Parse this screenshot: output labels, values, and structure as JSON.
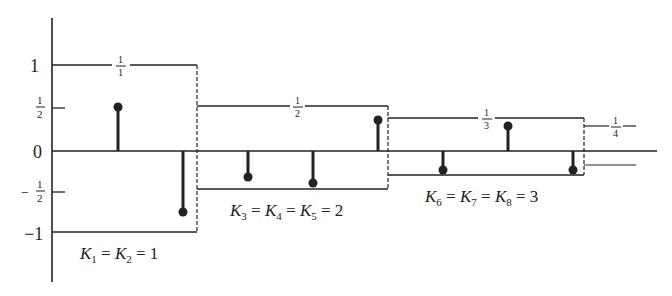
{
  "y_axis": {
    "ticks": [
      {
        "label": "1",
        "value": 1
      },
      {
        "num": "1",
        "den": "2",
        "value": 0.5
      },
      {
        "label": "0",
        "value": 0
      },
      {
        "sign": "−",
        "num": "1",
        "den": "2",
        "value": -0.5
      },
      {
        "label": "−1",
        "value": -1
      }
    ]
  },
  "groups": [
    {
      "name": "group-1",
      "fraction_num": "1",
      "fraction_den": "1",
      "level": 1.0,
      "label": "K",
      "subs": [
        "1",
        "2"
      ],
      "k_value": "1"
    },
    {
      "name": "group-2",
      "fraction_num": "1",
      "fraction_den": "2",
      "level": 0.5,
      "label": "K",
      "subs": [
        "3",
        "4",
        "5"
      ],
      "k_value": "2"
    },
    {
      "name": "group-3",
      "fraction_num": "1",
      "fraction_den": "3",
      "level": 0.333,
      "label": "K",
      "subs": [
        "6",
        "7",
        "8"
      ],
      "k_value": "3"
    },
    {
      "name": "group-4",
      "fraction_num": "1",
      "fraction_den": "4",
      "level": 0.25
    }
  ],
  "captions": {
    "g1": "= 1",
    "g2": "= 2",
    "g3": "= 3"
  },
  "stems": [
    0.52,
    -0.72,
    -0.31,
    -0.38,
    0.36,
    -0.22,
    0.3,
    -0.22
  ],
  "colors": {
    "ink": "#222222",
    "background": "#ffffff"
  }
}
